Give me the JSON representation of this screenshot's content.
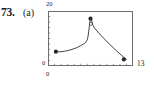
{
  "exercise": {
    "number": "73.",
    "part": "(a)"
  },
  "chart_data": {
    "type": "line",
    "title": "",
    "subtitle": "",
    "xlabel": "",
    "ylabel": "",
    "xlim": [
      0,
      13
    ],
    "ylim": [
      0,
      20
    ],
    "x_tick_labels": [
      "0",
      "13"
    ],
    "y_tick_labels": [
      "0",
      "20"
    ],
    "grid": false,
    "legend": null,
    "frame": "box",
    "x_tick_count": 13,
    "y_tick_count": 10,
    "series": [
      {
        "name": "curve",
        "x": [
          1,
          2,
          3,
          4,
          5,
          6,
          6.5,
          7,
          8,
          9,
          10,
          11,
          12
        ],
        "y": [
          5.2,
          5.2,
          5.6,
          6.3,
          7.4,
          9.6,
          17.0,
          14.2,
          11.4,
          8.9,
          6.6,
          4.4,
          2.4
        ]
      }
    ],
    "markers": [
      {
        "name": "left-data-point",
        "x": 1.2,
        "y": 5.2,
        "style": "filled"
      },
      {
        "name": "peak-data-point",
        "x": 6.5,
        "y": 17.2,
        "style": "filled"
      },
      {
        "name": "peak-open-point",
        "x": 6.55,
        "y": 15.3,
        "style": "open"
      },
      {
        "name": "right-data-point",
        "x": 11.6,
        "y": 2.4,
        "style": "filled"
      }
    ]
  },
  "colors": {
    "ink": "#1a1a1a",
    "frame": "#6e6e6e",
    "curve": "#2a2a2a",
    "background": "#ffffff"
  }
}
